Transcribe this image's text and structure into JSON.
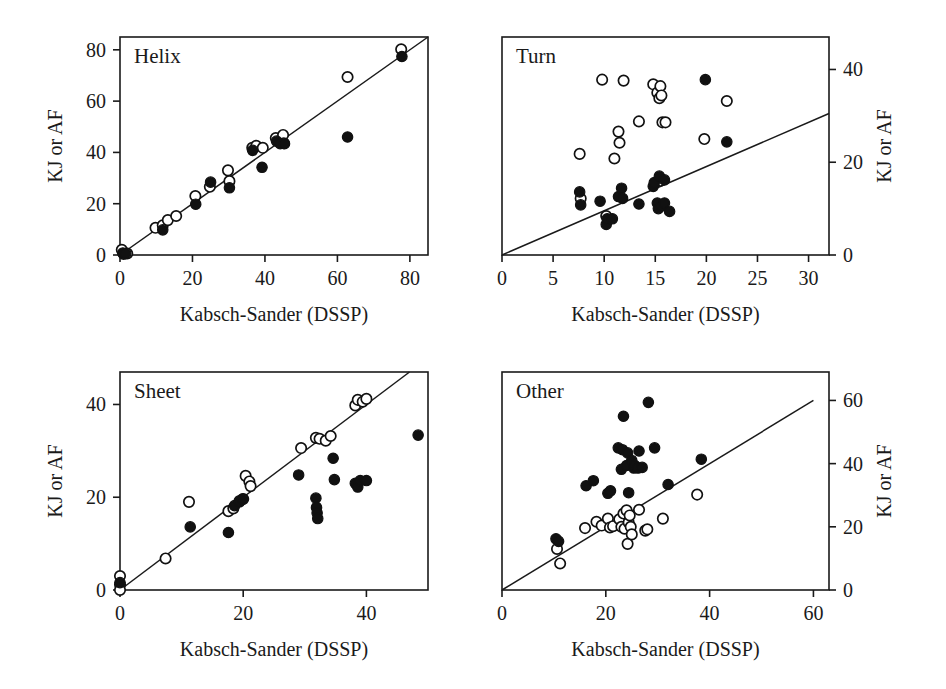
{
  "figure": {
    "background": "#ffffff",
    "ink_color": "#1a1a1a",
    "marker_open_fill": "#ffffff",
    "marker_filled_fill": "#111111",
    "shared_xlabel": "Kabsch-Sander (DSSP)",
    "shared_ylabel": "KJ or AF"
  },
  "chart_data": [
    {
      "type": "scatter",
      "title": "Helix",
      "panel": "top-left",
      "xlabel": "Kabsch-Sander (DSSP)",
      "ylabel": "KJ or AF",
      "yaxis_side": "left",
      "xlim": [
        0,
        85
      ],
      "ylim": [
        0,
        85
      ],
      "xticks": [
        0,
        20,
        40,
        60,
        80
      ],
      "yticks": [
        0,
        20,
        40,
        60,
        80
      ],
      "grid": false,
      "legend": "none",
      "reference_line": {
        "label": "y = x",
        "x0": 0,
        "y0": 0,
        "x1": 85,
        "y1": 85
      },
      "series": [
        {
          "name": "open-circles",
          "marker": "open-circle",
          "points": [
            [
              0.5,
              2.0
            ],
            [
              1.0,
              0.4
            ],
            [
              2.0,
              0.6
            ],
            [
              9.8,
              10.6
            ],
            [
              11.8,
              11.6
            ],
            [
              13.2,
              13.6
            ],
            [
              15.5,
              15.2
            ],
            [
              20.8,
              23.0
            ],
            [
              24.8,
              26.6
            ],
            [
              29.8,
              33.0
            ],
            [
              30.2,
              28.8
            ],
            [
              36.5,
              41.8
            ],
            [
              37.6,
              42.6
            ],
            [
              39.4,
              41.8
            ],
            [
              43.0,
              45.6
            ],
            [
              45.0,
              46.8
            ],
            [
              45.2,
              43.6
            ],
            [
              62.8,
              69.4
            ],
            [
              77.6,
              80.2
            ]
          ]
        },
        {
          "name": "filled-circles",
          "marker": "filled-circle",
          "points": [
            [
              0.8,
              0.8
            ],
            [
              1.6,
              0.6
            ],
            [
              11.8,
              9.8
            ],
            [
              20.9,
              19.8
            ],
            [
              25.0,
              28.4
            ],
            [
              30.2,
              26.2
            ],
            [
              36.6,
              40.8
            ],
            [
              39.2,
              34.2
            ],
            [
              43.2,
              44.4
            ],
            [
              44.2,
              43.4
            ],
            [
              45.4,
              43.4
            ],
            [
              62.8,
              46.0
            ],
            [
              77.8,
              77.4
            ]
          ]
        }
      ]
    },
    {
      "type": "scatter",
      "title": "Turn",
      "panel": "top-right",
      "xlabel": "Kabsch-Sander (DSSP)",
      "ylabel": "KJ or AF",
      "yaxis_side": "right",
      "xlim": [
        0,
        32
      ],
      "ylim": [
        0,
        47
      ],
      "xticks": [
        0,
        5,
        10,
        15,
        20,
        25,
        30
      ],
      "yticks": [
        0,
        20,
        40
      ],
      "grid": false,
      "legend": "none",
      "reference_line": {
        "label": "regression",
        "x0": 0,
        "y0": 0,
        "x1": 32,
        "y1": 30.5
      },
      "series": [
        {
          "name": "open-circles",
          "marker": "open-circle",
          "points": [
            [
              7.6,
              21.8
            ],
            [
              7.7,
              12.2
            ],
            [
              9.8,
              37.8
            ],
            [
              10.2,
              8.4
            ],
            [
              11.0,
              20.8
            ],
            [
              11.4,
              26.6
            ],
            [
              11.5,
              24.2
            ],
            [
              11.9,
              37.6
            ],
            [
              13.4,
              28.8
            ],
            [
              14.8,
              36.8
            ],
            [
              15.2,
              35.0
            ],
            [
              15.4,
              33.8
            ],
            [
              15.5,
              36.4
            ],
            [
              15.6,
              34.4
            ],
            [
              15.5,
              16.0
            ],
            [
              15.7,
              28.6
            ],
            [
              16.0,
              28.6
            ],
            [
              19.8,
              25.0
            ],
            [
              22.0,
              33.2
            ]
          ]
        },
        {
          "name": "filled-circles",
          "marker": "filled-circle",
          "points": [
            [
              7.6,
              13.6
            ],
            [
              7.7,
              10.8
            ],
            [
              9.6,
              11.6
            ],
            [
              10.2,
              6.6
            ],
            [
              10.3,
              7.8
            ],
            [
              10.8,
              7.8
            ],
            [
              11.4,
              12.6
            ],
            [
              11.7,
              14.4
            ],
            [
              11.8,
              12.2
            ],
            [
              13.4,
              11.0
            ],
            [
              14.8,
              14.8
            ],
            [
              14.9,
              15.6
            ],
            [
              15.2,
              11.2
            ],
            [
              15.3,
              10.0
            ],
            [
              15.4,
              17.0
            ],
            [
              15.6,
              10.6
            ],
            [
              15.9,
              16.2
            ],
            [
              15.9,
              11.2
            ],
            [
              16.4,
              9.4
            ],
            [
              19.9,
              37.8
            ],
            [
              22.0,
              24.4
            ]
          ]
        }
      ]
    },
    {
      "type": "scatter",
      "title": "Sheet",
      "panel": "bottom-left",
      "xlabel": "Kabsch-Sander (DSSP)",
      "ylabel": "KJ or AF",
      "yaxis_side": "left",
      "xlim": [
        0,
        50
      ],
      "ylim": [
        0,
        47
      ],
      "xticks": [
        0,
        20,
        40
      ],
      "yticks": [
        0,
        20,
        40
      ],
      "grid": false,
      "legend": "none",
      "reference_line": {
        "label": "y = x",
        "x0": 0,
        "y0": 0,
        "x1": 47,
        "y1": 47
      },
      "series": [
        {
          "name": "open-circles",
          "marker": "open-circle",
          "points": [
            [
              0.0,
              3.0
            ],
            [
              0.0,
              1.2
            ],
            [
              0.0,
              0.0
            ],
            [
              7.4,
              6.8
            ],
            [
              11.2,
              19.0
            ],
            [
              17.6,
              17.0
            ],
            [
              18.4,
              17.6
            ],
            [
              19.4,
              19.2
            ],
            [
              20.0,
              19.6
            ],
            [
              20.4,
              24.6
            ],
            [
              21.0,
              23.4
            ],
            [
              21.2,
              22.4
            ],
            [
              29.4,
              30.6
            ],
            [
              31.8,
              32.8
            ],
            [
              32.4,
              32.6
            ],
            [
              33.4,
              32.2
            ],
            [
              34.2,
              33.2
            ],
            [
              38.2,
              39.8
            ],
            [
              38.6,
              41.0
            ],
            [
              39.4,
              40.6
            ],
            [
              40.0,
              41.2
            ]
          ]
        },
        {
          "name": "filled-circles",
          "marker": "filled-circle",
          "points": [
            [
              0.0,
              1.6
            ],
            [
              11.4,
              13.6
            ],
            [
              17.6,
              12.4
            ],
            [
              18.6,
              18.2
            ],
            [
              19.4,
              19.0
            ],
            [
              19.9,
              19.6
            ],
            [
              29.0,
              24.8
            ],
            [
              31.8,
              19.8
            ],
            [
              31.9,
              17.8
            ],
            [
              32.0,
              16.6
            ],
            [
              32.1,
              15.4
            ],
            [
              34.6,
              28.4
            ],
            [
              34.8,
              23.8
            ],
            [
              38.2,
              23.0
            ],
            [
              38.6,
              22.2
            ],
            [
              39.0,
              23.6
            ],
            [
              40.0,
              23.6
            ],
            [
              48.4,
              33.4
            ]
          ]
        }
      ]
    },
    {
      "type": "scatter",
      "title": "Other",
      "panel": "bottom-right",
      "xlabel": "Kabsch-Sander (DSSP)",
      "ylabel": "KJ or AF",
      "yaxis_side": "right",
      "xlim": [
        0,
        63
      ],
      "ylim": [
        0,
        69
      ],
      "xticks": [
        0,
        20,
        40,
        60
      ],
      "yticks": [
        0,
        20,
        40,
        60
      ],
      "grid": false,
      "legend": "none",
      "reference_line": {
        "label": "y = x",
        "x0": 0,
        "y0": 0,
        "x1": 60,
        "y1": 60
      },
      "series": [
        {
          "name": "open-circles",
          "marker": "open-circle",
          "points": [
            [
              10.6,
              13.0
            ],
            [
              11.2,
              8.4
            ],
            [
              16.0,
              19.6
            ],
            [
              18.2,
              21.6
            ],
            [
              19.2,
              20.4
            ],
            [
              20.4,
              22.6
            ],
            [
              20.8,
              19.8
            ],
            [
              21.4,
              20.2
            ],
            [
              22.6,
              22.4
            ],
            [
              23.0,
              20.0
            ],
            [
              23.4,
              24.2
            ],
            [
              23.6,
              19.4
            ],
            [
              24.0,
              25.2
            ],
            [
              24.2,
              14.6
            ],
            [
              24.4,
              21.4
            ],
            [
              24.6,
              23.6
            ],
            [
              24.8,
              20.0
            ],
            [
              25.0,
              17.6
            ],
            [
              26.4,
              25.4
            ],
            [
              27.6,
              18.8
            ],
            [
              28.0,
              19.2
            ],
            [
              31.0,
              22.6
            ],
            [
              37.6,
              30.2
            ]
          ]
        },
        {
          "name": "filled-circles",
          "marker": "filled-circle",
          "points": [
            [
              10.4,
              16.2
            ],
            [
              10.9,
              15.4
            ],
            [
              16.2,
              33.0
            ],
            [
              17.6,
              34.6
            ],
            [
              20.4,
              30.6
            ],
            [
              20.9,
              31.4
            ],
            [
              22.4,
              45.0
            ],
            [
              23.0,
              38.2
            ],
            [
              23.2,
              44.4
            ],
            [
              23.4,
              55.0
            ],
            [
              24.0,
              39.4
            ],
            [
              24.2,
              43.4
            ],
            [
              24.4,
              30.8
            ],
            [
              25.0,
              41.0
            ],
            [
              25.4,
              38.6
            ],
            [
              25.6,
              39.4
            ],
            [
              26.2,
              38.6
            ],
            [
              26.4,
              44.0
            ],
            [
              27.0,
              38.8
            ],
            [
              28.2,
              59.4
            ],
            [
              29.4,
              45.0
            ],
            [
              32.0,
              33.4
            ],
            [
              38.4,
              41.4
            ]
          ]
        }
      ]
    }
  ]
}
